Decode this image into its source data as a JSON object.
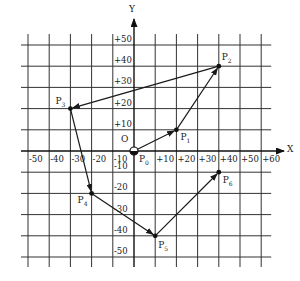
{
  "diagram": {
    "axes": {
      "x_label": "X",
      "y_label": "Y",
      "origin_label": "O",
      "x_ticks": [
        "-50",
        "-40",
        "-30",
        "-20",
        "-10",
        "+10",
        "+20",
        "+30",
        "+40",
        "+50",
        "+60"
      ],
      "x_tick_values": [
        -50,
        -40,
        -30,
        -20,
        -10,
        10,
        20,
        30,
        40,
        50,
        60
      ],
      "y_ticks": [
        "+50",
        "+40",
        "+30",
        "+20",
        "+10",
        "-10",
        "-20",
        "-30",
        "-40",
        "-50"
      ],
      "y_tick_values": [
        50,
        40,
        30,
        20,
        10,
        -10,
        -20,
        -30,
        -40,
        -50
      ],
      "x_range": [
        -50,
        60
      ],
      "y_range": [
        -50,
        50
      ],
      "grid_step": 10,
      "grid": true
    },
    "points": [
      {
        "name": "P",
        "sub": "0",
        "x": 0,
        "y": 0
      },
      {
        "name": "P",
        "sub": "1",
        "x": 20,
        "y": 10
      },
      {
        "name": "P",
        "sub": "2",
        "x": 40,
        "y": 40
      },
      {
        "name": "P",
        "sub": "3",
        "x": -30,
        "y": 20
      },
      {
        "name": "P",
        "sub": "4",
        "x": -20,
        "y": -20
      },
      {
        "name": "P",
        "sub": "5",
        "x": 10,
        "y": -40
      },
      {
        "name": "P",
        "sub": "6",
        "x": 40,
        "y": -10
      }
    ],
    "path_order": [
      "P0",
      "P1",
      "P2",
      "P3",
      "P4",
      "P5",
      "P6"
    ],
    "colors": {
      "line": "#1a1a1a",
      "grid": "#333333",
      "background": "#ffffff"
    }
  }
}
